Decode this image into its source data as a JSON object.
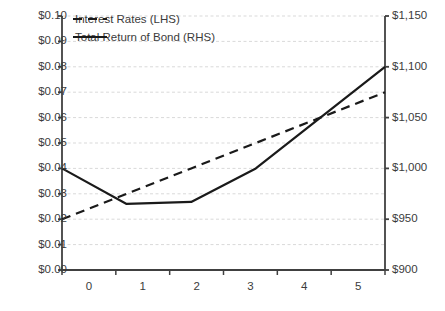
{
  "chart_data": {
    "type": "line",
    "title": "",
    "xlabel": "",
    "categories": [
      "0",
      "1",
      "2",
      "3",
      "4",
      "5"
    ],
    "grid": true,
    "legend_position": "top-left",
    "series": [
      {
        "name": "Interest Rates (LHS)",
        "axis": "left",
        "style": "dashed",
        "color": "#1a1a1a",
        "values": [
          0.02,
          0.03,
          0.04,
          0.05,
          0.06,
          0.07
        ]
      },
      {
        "name": "Total Return of Bond (RHS)",
        "axis": "right",
        "style": "solid",
        "color": "#1a1a1a",
        "values": [
          1000,
          965,
          967,
          1000,
          1050,
          1100
        ]
      }
    ],
    "left_axis": {
      "label": "",
      "ylim": [
        0.0,
        0.1
      ],
      "tick_step": 0.01,
      "ticks": [
        "$0.00",
        "$0.01",
        "$0.02",
        "$0.03",
        "$0.04",
        "$0.05",
        "$0.06",
        "$0.07",
        "$0.08",
        "$0.09",
        "$0.10"
      ],
      "tick_values": [
        0.0,
        0.01,
        0.02,
        0.03,
        0.04,
        0.05,
        0.06,
        0.07,
        0.08,
        0.09,
        0.1
      ]
    },
    "right_axis": {
      "label": "",
      "ylim": [
        900,
        1150
      ],
      "tick_step": 50,
      "ticks": [
        "$900",
        "$950",
        "$1,000",
        "$1,050",
        "$1,100",
        "$1,150"
      ],
      "tick_values": [
        900,
        950,
        1000,
        1050,
        1100,
        1150
      ]
    },
    "colors": {
      "gridline": "#d9d9d9",
      "axis": "#404040",
      "text": "#3b3b3b",
      "series": "#1a1a1a"
    }
  },
  "legend": {
    "items": [
      {
        "label": "Interest Rates (LHS)",
        "marker": "dashed-line-icon"
      },
      {
        "label": "Total Return of Bond (RHS)",
        "marker": "solid-line-icon"
      }
    ]
  }
}
